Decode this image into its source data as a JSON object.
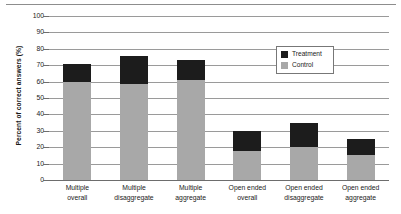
{
  "chart_data": {
    "type": "bar",
    "stacked": true,
    "title": "",
    "xlabel": "",
    "ylabel": "Percent of correct answers (%)",
    "ylim": [
      0,
      100
    ],
    "yticks": [
      0,
      10,
      20,
      30,
      40,
      50,
      60,
      70,
      80,
      90,
      100
    ],
    "ytick_labels": [
      "0",
      "10",
      "20",
      "30",
      "40",
      "50",
      "60",
      "70",
      "80",
      "90",
      "100"
    ],
    "grid": true,
    "legend_position": "upper-right-inside",
    "categories": [
      "Multiple overall",
      "Multiple disaggregate",
      "Multiple aggregate",
      "Open ended overall",
      "Open ended disaggregate",
      "Open ended aggregate"
    ],
    "category_lines": [
      [
        "Multiple",
        "overall"
      ],
      [
        "Multiple",
        "disaggregate"
      ],
      [
        "Multiple",
        "aggregate"
      ],
      [
        "Open ended",
        "overall"
      ],
      [
        "Open ended",
        "disaggregate"
      ],
      [
        "Open ended",
        "aggregate"
      ]
    ],
    "series": [
      {
        "name": "Control",
        "color": "#a8a8a8",
        "values": [
          60,
          58.5,
          61,
          17.5,
          20,
          15.5
        ]
      },
      {
        "name": "Treatment",
        "color": "#1c1c1c",
        "values": [
          71,
          75.5,
          73,
          30,
          35,
          25
        ]
      }
    ],
    "segment_heights": {
      "control": [
        60,
        58.5,
        61,
        17.5,
        20,
        15.5
      ],
      "treatment_segment": [
        11,
        17,
        12,
        12.5,
        15,
        9.5
      ]
    },
    "legend_entries": [
      {
        "label": "Treatment",
        "color": "#1c1c1c"
      },
      {
        "label": "Control",
        "color": "#a8a8a8"
      }
    ]
  }
}
